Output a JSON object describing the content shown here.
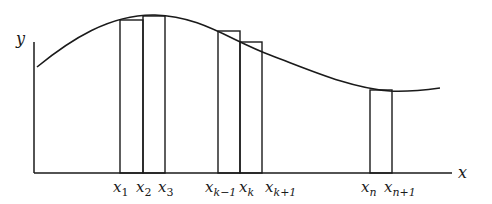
{
  "diagram": {
    "axes": {
      "x_label": "x",
      "y_label": "y"
    },
    "partition_labels": [
      {
        "base": "x",
        "sub": "1",
        "sub_italic": false
      },
      {
        "base": "x",
        "sub": "2",
        "sub_italic": false
      },
      {
        "base": "x",
        "sub": "3",
        "sub_italic": false
      },
      {
        "base": "x",
        "sub": "k−1",
        "sub_italic": true
      },
      {
        "base": "x",
        "sub": "k",
        "sub_italic": true
      },
      {
        "base": "x",
        "sub": "k+1",
        "sub_italic": true
      },
      {
        "base": "x",
        "sub": "n",
        "sub_italic": true
      },
      {
        "base": "x",
        "sub": "n+1",
        "sub_italic": true
      }
    ],
    "colors": {
      "stroke": "#1a1a1a",
      "background": "#ffffff"
    }
  }
}
